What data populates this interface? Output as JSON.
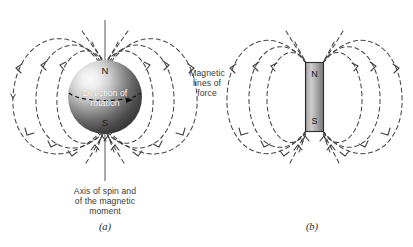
{
  "figure": {
    "background_color": "#ffffff",
    "width": 413,
    "height": 247
  },
  "panel_a": {
    "caption": "(a)",
    "pole_north": "N",
    "pole_south": "S",
    "rotation_label_line1": "Direction of",
    "rotation_label_line2": "rotation",
    "axis_label_line1": "Axis of spin and",
    "axis_label_line2": "of the magnetic",
    "axis_label_line3": "moment",
    "sphere_fill_light": "#f2f2f2",
    "sphere_fill_dark": "#3d3d3d",
    "axis_line_color": "#8e8e8e",
    "field_line_color": "#4a4a4a"
  },
  "panel_b": {
    "caption": "(b)",
    "pole_north": "N",
    "pole_south": "S",
    "magnet_fill_light": "#cfcfcf",
    "magnet_fill_dark": "#6e6e6e",
    "magnet_border_color": "#2b2b2b",
    "field_line_color": "#4a4a4a"
  },
  "annotations": {
    "field_label_line1": "Magnetic",
    "field_label_line2": "lines of",
    "field_label_line3": "force"
  }
}
